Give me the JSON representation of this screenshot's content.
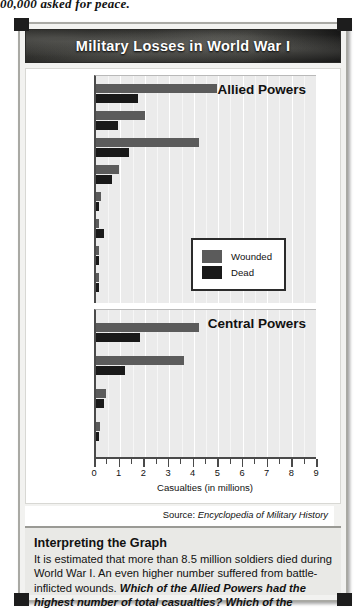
{
  "page": {
    "top_cutoff_text": "00,000 asked for peace."
  },
  "figure": {
    "title": "Military Losses in World War I",
    "source_prefix": "Source:",
    "source_title": "Encyclopedia of Military History"
  },
  "legend": {
    "position": "inside-allied-panel-bottom-right",
    "items": [
      {
        "label": "Wounded",
        "color": "#5b5b5b"
      },
      {
        "label": "Dead",
        "color": "#191919"
      }
    ]
  },
  "axis": {
    "title": "Casualties (in millions)",
    "ticks": [
      "0",
      "1",
      "2",
      "3",
      "4",
      "5",
      "6",
      "7",
      "8",
      "9"
    ],
    "min": 0,
    "max": 9
  },
  "chart_data": [
    {
      "type": "bar",
      "orientation": "horizontal",
      "title": "Allied Powers",
      "xlabel": "Casualties (in millions)",
      "ylabel": "",
      "xlim": [
        0,
        9
      ],
      "grid": true,
      "legend": [
        "Wounded",
        "Dead"
      ],
      "categories": [
        "Russia",
        "British Empire",
        "France",
        "Italy",
        "United States",
        "Romania",
        "Serbia",
        "Belgium"
      ],
      "series": [
        {
          "name": "Wounded",
          "color": "#5b5b5b",
          "values": [
            4.95,
            2.0,
            4.2,
            0.95,
            0.2,
            0.12,
            0.13,
            0.04
          ]
        },
        {
          "name": "Dead",
          "color": "#191919",
          "values": [
            1.7,
            0.9,
            1.35,
            0.65,
            0.12,
            0.34,
            0.05,
            0.01
          ]
        }
      ]
    },
    {
      "type": "bar",
      "orientation": "horizontal",
      "title": "Central Powers",
      "xlabel": "Casualties (in millions)",
      "ylabel": "",
      "xlim": [
        0,
        9
      ],
      "grid": true,
      "legend": [
        "Wounded",
        "Dead"
      ],
      "categories": [
        "Germany",
        "Austria-Hungary",
        "Turkey",
        "Bulgaria"
      ],
      "series": [
        {
          "name": "Wounded",
          "color": "#5b5b5b",
          "values": [
            4.2,
            3.6,
            0.4,
            0.15
          ]
        },
        {
          "name": "Dead",
          "color": "#191919",
          "values": [
            1.8,
            1.2,
            0.33,
            0.09
          ]
        }
      ]
    }
  ],
  "interpreting": {
    "heading": "Interpreting the Graph",
    "body_plain": "It is estimated that more than 8.5 million soldiers died during World War I. An even higher number suffered from battle-inflicted wounds. ",
    "body_bold": "Which of the Allied Powers had the highest number of total casualties? Which of the Central Powers had the highest casualties?"
  }
}
